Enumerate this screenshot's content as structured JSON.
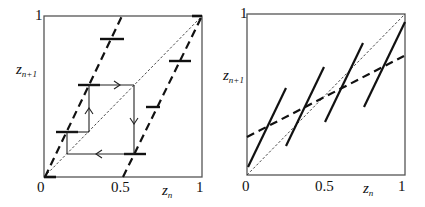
{
  "panels": [
    {
      "id": "left",
      "axis": {
        "x_label_main": "z",
        "x_label_sub": "n",
        "y_label_main": "z",
        "y_label_sub": "n+1",
        "x_ticks": [
          "0",
          "0.5",
          "1"
        ],
        "y_ticks": [
          "1"
        ]
      },
      "elements": {
        "diagonal": "thin dashed identity line",
        "map_branches": "two thick dashed steep lines",
        "plateaus": "short thick horizontal bars on branches",
        "cycle": "rectangular cobweb cycle with arrows"
      }
    },
    {
      "id": "right",
      "axis": {
        "x_label_main": "z",
        "x_label_sub": "n",
        "y_label_main": "z",
        "y_label_sub": "n+1",
        "x_ticks": [
          "0",
          "0.5",
          "1"
        ],
        "y_ticks": [
          "1"
        ]
      },
      "elements": {
        "diagonal": "thin dashed identity line",
        "map_segments": "five thick solid steep segments",
        "average_line": "thick dashed shallow line"
      }
    }
  ]
}
